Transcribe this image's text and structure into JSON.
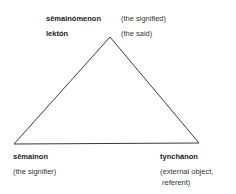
{
  "diagram": {
    "type": "semiotic-triangle",
    "top": {
      "term1": "sēmainómenon",
      "gloss1": "(the signified)",
      "term2": "lektón",
      "gloss2": "(the said)"
    },
    "bottom_left": {
      "term": "sēmainon",
      "gloss": "(the signifier)"
    },
    "bottom_right": {
      "term": "tynchánon",
      "gloss_line1": "(external object,",
      "gloss_line2": "referent)"
    }
  }
}
